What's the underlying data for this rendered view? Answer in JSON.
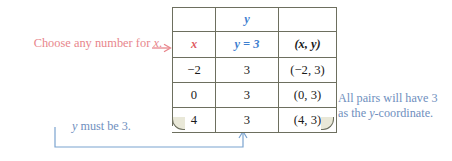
{
  "annotations": {
    "left": {
      "text_before": "Choose any number for ",
      "var": "x",
      "text_after": ".",
      "color": "#e8868c",
      "arrow": "right-arrow-icon"
    },
    "right": {
      "line1": "All pairs will have 3",
      "line2_before": "as the ",
      "line2_var": "y",
      "line2_after": "-coordinate.",
      "color": "#6f8fbe"
    },
    "bottom": {
      "var": "y",
      "text": " must be 3.",
      "color": "#6f8fbe",
      "arrow": "up-arrow-icon"
    }
  },
  "table": {
    "group_header": "y",
    "columns": [
      "x",
      "y = 3",
      "(x, y)"
    ],
    "column_colors": [
      "#e05b62",
      "#3f7fd0",
      "#1a1a1a"
    ],
    "rows": [
      {
        "x": "−2",
        "y": "3",
        "pair": "(−2, 3)"
      },
      {
        "x": "0",
        "y": "3",
        "pair": "(0, 3)"
      },
      {
        "x": "4",
        "y": "3",
        "pair": "(4, 3)"
      }
    ],
    "row_fill": "#e9e8d8",
    "border_color": "#6d6f5f"
  }
}
